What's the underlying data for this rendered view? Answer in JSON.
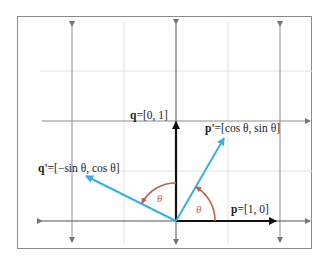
{
  "diagram": {
    "colors": {
      "frame": "#8a8a8a",
      "grid_major": "#8c8c8c",
      "grid_minor": "#dcdcdc",
      "basis_vector": "#111111",
      "rotated_vector": "#3aaee0",
      "angle_arc": "#c0634a",
      "text": "#222222"
    },
    "vectors": [
      {
        "id": "p",
        "name": "p",
        "value": "[1, 0]",
        "color": "basis"
      },
      {
        "id": "q",
        "name": "q",
        "value": "[0, 1]",
        "color": "basis"
      },
      {
        "id": "p_prime",
        "name": "p'",
        "value": "[cos θ, sin θ]",
        "color": "rotated"
      },
      {
        "id": "q_prime",
        "name": "q'",
        "value": "[−sin θ, cos θ]",
        "color": "rotated"
      }
    ],
    "labels": {
      "p_name": "p",
      "p_value": "=[1, 0]",
      "q_name": "q",
      "q_value": "=[0, 1]",
      "p_prime_name": "p'",
      "p_prime_value": "=[cos θ, sin θ]",
      "q_prime_name": "q'",
      "q_prime_value": "=[−sin θ, cos θ]",
      "angle_1": "θ",
      "angle_2": "θ"
    }
  }
}
